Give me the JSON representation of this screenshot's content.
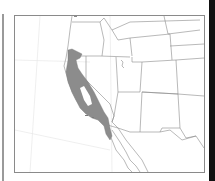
{
  "map": {
    "type": "species-range-map",
    "region": "Western United States and Baja California",
    "range_fill_color": "#8c8c8c",
    "border_color": "#7a7a7a",
    "frame_color": "#808080",
    "background_color": "#ffffff"
  }
}
